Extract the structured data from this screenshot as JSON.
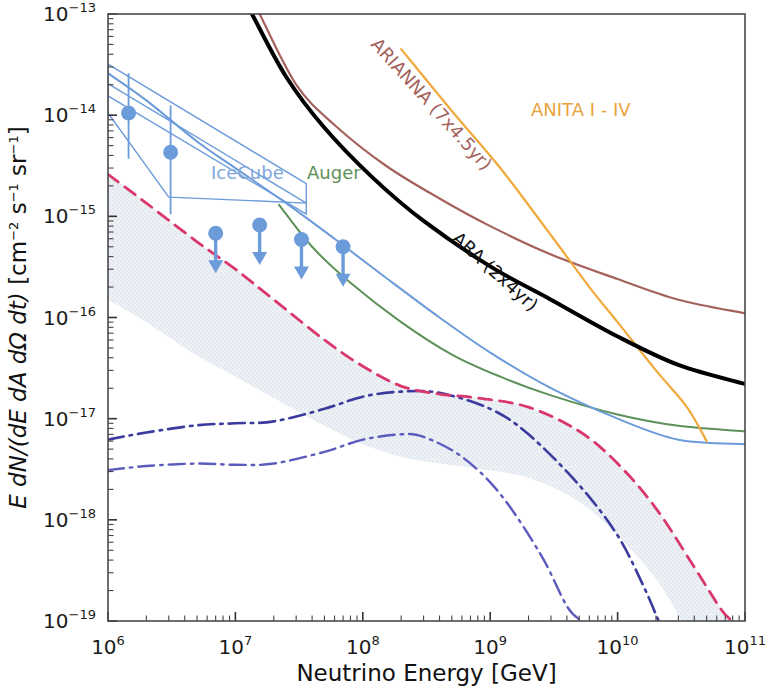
{
  "figure": {
    "type": "scientific-flux-limit-plot",
    "background": "#ffffff"
  },
  "axes": {
    "x": {
      "label": "Neutrino Energy [GeV]",
      "scale": "log",
      "range": [
        1000000.0,
        100000000000.0
      ],
      "tick_mantissa": "10",
      "ticks": [
        {
          "exp": "6",
          "value": 1000000.0
        },
        {
          "exp": "7",
          "value": 10000000.0
        },
        {
          "exp": "8",
          "value": 100000000.0
        },
        {
          "exp": "9",
          "value": 1000000000.0
        },
        {
          "exp": "10",
          "value": 10000000000.0
        },
        {
          "exp": "11",
          "value": 100000000000.0
        }
      ]
    },
    "y": {
      "label_parts": {
        "italic_main": "E dN/(dE dA dΩ dt)",
        "bracket": " [cm",
        "sup1": "−2",
        "mid1": " s",
        "sup2": "−1",
        "mid2": " sr",
        "sup3": "−1",
        "close": "]"
      },
      "label_plain": "E dN/(dE dA dΩ dt) [cm−2 s−1 sr−1]",
      "scale": "log",
      "range": [
        1e-19,
        1e-13
      ],
      "tick_mantissa": "10",
      "ticks": [
        {
          "exp": "−13",
          "value": 1e-13
        },
        {
          "exp": "−14",
          "value": 1e-14
        },
        {
          "exp": "−15",
          "value": 1e-15
        },
        {
          "exp": "−16",
          "value": 1e-16
        },
        {
          "exp": "−17",
          "value": 1e-17
        },
        {
          "exp": "−18",
          "value": 1e-18
        },
        {
          "exp": "−19",
          "value": 1e-19
        }
      ]
    }
  },
  "annotations": [
    {
      "name": "icecube-label",
      "text": "IceCube",
      "color": "#7FA6DC",
      "x": 211,
      "y": 179,
      "rotate": 0,
      "size": 18
    },
    {
      "name": "auger-label",
      "text": "Auger",
      "color": "#5E9159",
      "x": 307,
      "y": 179,
      "rotate": 0,
      "size": 18
    },
    {
      "name": "arianna-label",
      "text": "ARIANNA (7x4.5yr)",
      "color": "#A4625C",
      "x": 370,
      "y": 45,
      "rotate": 48,
      "size": 18
    },
    {
      "name": "ara-label",
      "text": "ARA (2x4yr)",
      "color": "#111111",
      "x": 451,
      "y": 240,
      "rotate": 42,
      "size": 19
    },
    {
      "name": "anita-label",
      "text": "ANITA I - IV",
      "color": "#E8A33D",
      "x": 531,
      "y": 116,
      "rotate": 0,
      "size": 18
    }
  ],
  "chart_data": {
    "type": "line",
    "title": "",
    "xlabel": "Neutrino Energy [GeV]",
    "ylabel": "E dN/(dE dA dΩ dt) [cm−2 s−1 sr−1]",
    "xscale": "log",
    "yscale": "log",
    "xlim": [
      1000000.0,
      100000000000.0
    ],
    "ylim": [
      1e-19,
      1e-13
    ],
    "grid": false,
    "legend": "inline-curve-labels",
    "series": [
      {
        "name": "ARIANNA (7x4.5yr)",
        "style": "solid",
        "color": "#A4625C",
        "width": 2.2,
        "points": [
          [
            15500000.0,
            1e-13
          ],
          [
            30000000.0,
            2e-14
          ],
          [
            60000000.0,
            8e-15
          ],
          [
            150000000.0,
            3.2e-15
          ],
          [
            400000000.0,
            1.5e-15
          ],
          [
            1000000000.0,
            8e-16
          ],
          [
            3000000000.0,
            4.2e-16
          ],
          [
            10000000000.0,
            2.4e-16
          ],
          [
            30000000000.0,
            1.5e-16
          ],
          [
            100000000000.0,
            1.1e-16
          ]
        ]
      },
      {
        "name": "ARA (2x4yr)",
        "style": "solid",
        "color": "#000000",
        "width": 4.0,
        "points": [
          [
            13500000.0,
            1e-13
          ],
          [
            25000000.0,
            2.4e-14
          ],
          [
            50000000.0,
            7.5e-15
          ],
          [
            120000000.0,
            2.4e-15
          ],
          [
            300000000.0,
            9e-16
          ],
          [
            1000000000.0,
            3.2e-16
          ],
          [
            3000000000.0,
            1.5e-16
          ],
          [
            10000000000.0,
            6.5e-17
          ],
          [
            30000000000.0,
            3.4e-17
          ],
          [
            100000000000.0,
            2.2e-17
          ]
        ]
      },
      {
        "name": "ANITA I - IV",
        "style": "solid",
        "color": "#F0A93C",
        "width": 2.2,
        "points": [
          [
            200000000.0,
            4.5e-14
          ],
          [
            500000000.0,
            1.1e-14
          ],
          [
            1200000000.0,
            3e-15
          ],
          [
            3000000000.0,
            6.5e-16
          ],
          [
            6000000000.0,
            2e-16
          ],
          [
            10000000000.0,
            9e-17
          ],
          [
            20000000000.0,
            3e-17
          ],
          [
            35000000000.0,
            1.3e-17
          ],
          [
            50000000000.0,
            6e-18
          ]
        ]
      },
      {
        "name": "Auger",
        "style": "solid",
        "color": "#5E9159",
        "width": 2.0,
        "points": [
          [
            22000000.0,
            1.3e-15
          ],
          [
            40000000.0,
            5e-16
          ],
          [
            80000000.0,
            2.2e-16
          ],
          [
            200000000.0,
            9e-17
          ],
          [
            500000000.0,
            4.3e-17
          ],
          [
            1200000000.0,
            2.6e-17
          ],
          [
            3000000000.0,
            1.7e-17
          ],
          [
            10000000000.0,
            1.1e-17
          ],
          [
            30000000000.0,
            8.5e-18
          ],
          [
            100000000000.0,
            7.5e-18
          ]
        ]
      },
      {
        "name": "IceCube limit",
        "style": "solid",
        "color": "#6C9BD9",
        "width": 2.0,
        "points": [
          [
            1000000.0,
            2.6e-14
          ],
          [
            2000000.0,
            1.4e-14
          ],
          [
            5000000.0,
            5.5e-15
          ],
          [
            10000000.0,
            3e-15
          ],
          [
            25000000.0,
            1.35e-15
          ],
          [
            60000000.0,
            6e-16
          ],
          [
            150000000.0,
            2.5e-16
          ],
          [
            400000000.0,
            1e-16
          ],
          [
            1000000000.0,
            4.5e-17
          ],
          [
            3000000000.0,
            2e-17
          ],
          [
            10000000000.0,
            1e-17
          ],
          [
            30000000000.0,
            6.2e-18
          ],
          [
            100000000000.0,
            5.6e-18
          ]
        ]
      },
      {
        "name": "Cosmogenic model upper",
        "style": "dashdot",
        "color": "#3B3B9E",
        "width": 2.6,
        "points": [
          [
            1000000.0,
            6.2e-18
          ],
          [
            2000000.0,
            7.3e-18
          ],
          [
            5000000.0,
            8.6e-18
          ],
          [
            10000000.0,
            9e-18
          ],
          [
            20000000.0,
            9.4e-18
          ],
          [
            50000000.0,
            1.25e-17
          ],
          [
            100000000.0,
            1.65e-17
          ],
          [
            200000000.0,
            1.85e-17
          ],
          [
            400000000.0,
            1.8e-17
          ],
          [
            1000000000.0,
            1.25e-17
          ],
          [
            2000000000.0,
            7e-18
          ],
          [
            5000000000.0,
            2.2e-18
          ],
          [
            10000000000.0,
            7e-19
          ],
          [
            16000000000.0,
            2.2e-19
          ],
          [
            21000000000.0,
            1e-19
          ]
        ]
      },
      {
        "name": "Cosmogenic model lower",
        "style": "dashdot",
        "color": "#5B5BBE",
        "width": 2.4,
        "points": [
          [
            1000000.0,
            3.1e-18
          ],
          [
            2000000.0,
            3.4e-18
          ],
          [
            5000000.0,
            3.6e-18
          ],
          [
            10000000.0,
            3.5e-18
          ],
          [
            20000000.0,
            3.6e-18
          ],
          [
            50000000.0,
            4.7e-18
          ],
          [
            100000000.0,
            6.2e-18
          ],
          [
            200000000.0,
            7e-18
          ],
          [
            300000000.0,
            6.6e-18
          ],
          [
            600000000.0,
            4.2e-18
          ],
          [
            1200000000.0,
            1.8e-18
          ],
          [
            2500000000.0,
            4.5e-19
          ],
          [
            4000000000.0,
            1.4e-19
          ],
          [
            5200000000.0,
            1e-19
          ]
        ]
      },
      {
        "name": "Astrophysical flux best fit",
        "style": "dashed",
        "color": "#D9386E",
        "width": 2.8,
        "points": [
          [
            1000000.0,
            2.6e-15
          ],
          [
            2000000.0,
            1.35e-15
          ],
          [
            5000000.0,
            5.6e-16
          ],
          [
            10000000.0,
            3e-16
          ],
          [
            20000000.0,
            1.5e-16
          ],
          [
            50000000.0,
            6e-17
          ],
          [
            100000000.0,
            3.3e-17
          ],
          [
            200000000.0,
            2.1e-17
          ],
          [
            400000000.0,
            1.75e-17
          ],
          [
            800000000.0,
            1.6e-17
          ],
          [
            2000000000.0,
            1.3e-17
          ],
          [
            5000000000.0,
            7.5e-18
          ],
          [
            10000000000.0,
            3.6e-18
          ],
          [
            20000000000.0,
            1.3e-18
          ],
          [
            40000000000.0,
            3.4e-19
          ],
          [
            65000000000.0,
            1.3e-19
          ],
          [
            80000000000.0,
            1e-19
          ]
        ]
      }
    ],
    "band": {
      "name": "Astrophysical flux uncertainty band",
      "fill": "#E6EAF0",
      "texture": "stippled",
      "upper": [
        [
          1000000.0,
          2.6e-15
        ],
        [
          2000000.0,
          1.35e-15
        ],
        [
          5000000.0,
          5.6e-16
        ],
        [
          10000000.0,
          3e-16
        ],
        [
          20000000.0,
          1.5e-16
        ],
        [
          50000000.0,
          6e-17
        ],
        [
          100000000.0,
          3.3e-17
        ],
        [
          200000000.0,
          2.1e-17
        ],
        [
          400000000.0,
          1.75e-17
        ],
        [
          800000000.0,
          1.6e-17
        ],
        [
          2000000000.0,
          1.3e-17
        ],
        [
          5000000000.0,
          7.5e-18
        ],
        [
          10000000000.0,
          3.6e-18
        ],
        [
          20000000000.0,
          1.3e-18
        ],
        [
          40000000000.0,
          3.4e-19
        ],
        [
          65000000000.0,
          1.3e-19
        ],
        [
          80000000000.0,
          1e-19
        ]
      ],
      "lower": [
        [
          1000000.0,
          1.5e-16
        ],
        [
          2000000.0,
          9e-17
        ],
        [
          5000000.0,
          4.2e-17
        ],
        [
          10000000.0,
          2.6e-17
        ],
        [
          20000000.0,
          1.6e-17
        ],
        [
          50000000.0,
          8.5e-18
        ],
        [
          100000000.0,
          5.6e-18
        ],
        [
          200000000.0,
          4.2e-18
        ],
        [
          400000000.0,
          3.6e-18
        ],
        [
          800000000.0,
          3.2e-18
        ],
        [
          2000000000.0,
          2.6e-18
        ],
        [
          5000000000.0,
          1.5e-18
        ],
        [
          10000000000.0,
          7e-19
        ],
        [
          20000000000.0,
          2.6e-19
        ],
        [
          32000000000.0,
          1e-19
        ]
      ]
    },
    "icecube_bowtie": {
      "name": "IceCube measured flux butterfly",
      "color": "#6C9BD9",
      "width": 1.4,
      "bands": [
        {
          "label": "band-upper",
          "vertices": [
            [
              1000000.0,
              3.2e-14
            ],
            [
              36000000.0,
              2.1e-15
            ],
            [
              36000000.0,
              1.05e-15
            ],
            [
              1000000.0,
              1.55e-14
            ]
          ]
        },
        {
          "label": "band-lower",
          "vertices": [
            [
              1000000.0,
              2.05e-14
            ],
            [
              36000000.0,
              1.35e-15
            ],
            [
              3000000.0,
              1.55e-15
            ],
            [
              1000000.0,
              1.05e-14
            ]
          ]
        }
      ]
    },
    "icecube_points": [
      {
        "x": 1450000.0,
        "y": 1.05e-14,
        "kind": "measurement",
        "err_lo": 3.7e-15,
        "err_hi": 2.6e-14
      },
      {
        "x": 3100000.0,
        "y": 4.3e-15,
        "kind": "measurement",
        "err_lo": 1.05e-15,
        "err_hi": 1.25e-14
      },
      {
        "x": 7000000.0,
        "y": 6.8e-16,
        "kind": "upper-limit"
      },
      {
        "x": 15500000.0,
        "y": 8.2e-16,
        "kind": "upper-limit"
      },
      {
        "x": 33000000.0,
        "y": 5.9e-16,
        "kind": "upper-limit"
      },
      {
        "x": 70000000.0,
        "y": 5e-16,
        "kind": "upper-limit"
      }
    ]
  }
}
